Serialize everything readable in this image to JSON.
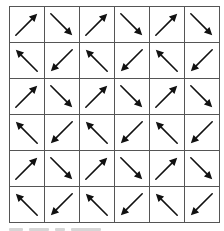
{
  "diagram": {
    "type": "arrow-grid",
    "rows": 6,
    "cols": 6,
    "line_color": "#555555",
    "arrow_color": "#111111",
    "directions_legend": {
      "NE": "up-right",
      "SE": "down-right",
      "NW": "up-left",
      "SW": "down-left"
    },
    "cells": [
      [
        "NE",
        "SE",
        "NE",
        "SE",
        "NE",
        "SE"
      ],
      [
        "NW",
        "SW",
        "NW",
        "SW",
        "NW",
        "SW"
      ],
      [
        "NE",
        "SE",
        "NE",
        "SE",
        "NE",
        "SE"
      ],
      [
        "NW",
        "SW",
        "NW",
        "SW",
        "NW",
        "SW"
      ],
      [
        "NE",
        "SE",
        "NE",
        "SE",
        "NE",
        "SE"
      ],
      [
        "NW",
        "SW",
        "NW",
        "SW",
        "NW",
        "SW"
      ]
    ]
  },
  "caption": {
    "visible_text": "",
    "note_clipped": true,
    "chunks": [
      14,
      20,
      10,
      30
    ]
  }
}
